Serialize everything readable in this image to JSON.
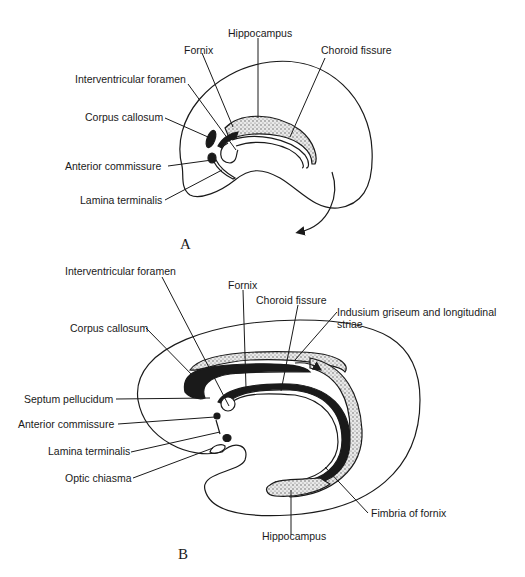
{
  "diagram": {
    "panel_a": {
      "letter": "A",
      "labels": {
        "hippocampus": "Hippocampus",
        "fornix": "Fornix",
        "choroid_fissure": "Choroid fissure",
        "interventricular_foramen": "Interventricular foramen",
        "corpus_callosum": "Corpus callosum",
        "anterior_commissure": "Anterior commissure",
        "lamina_terminalis": "Lamina terminalis"
      }
    },
    "panel_b": {
      "letter": "B",
      "labels": {
        "interventricular_foramen": "Interventricular foramen",
        "fornix": "Fornix",
        "choroid_fissure": "Choroid fissure",
        "indusium_line1": "Indusium griseum and longitudinal",
        "indusium_line2": "striae",
        "corpus_callosum": "Corpus callosum",
        "septum_pellucidum": "Septum pellucidum",
        "anterior_commissure": "Anterior commissure",
        "lamina_terminalis": "Lamina terminalis",
        "optic_chiasma": "Optic chiasma",
        "fimbria_of_fornix": "Fimbria of fornix",
        "hippocampus": "Hippocampus"
      }
    },
    "colors": {
      "ink": "#1a1a1a",
      "stipple": "#8a8a8a",
      "background": "#ffffff"
    }
  }
}
